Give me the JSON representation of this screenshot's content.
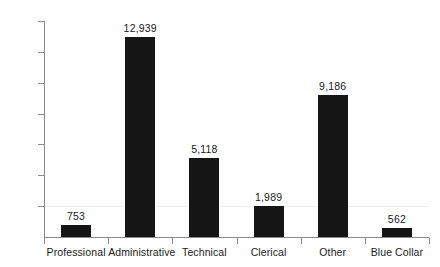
{
  "chart_data": {
    "type": "bar",
    "title": "",
    "subtitle": "",
    "xlabel": "",
    "ylabel": "",
    "categories": [
      "Professional",
      "Administrative",
      "Technical",
      "Clerical",
      "Other",
      "Blue Collar"
    ],
    "values": [
      753,
      12939,
      5118,
      1989,
      9186,
      562
    ],
    "value_labels": [
      "753",
      "12,939",
      "5,118",
      "1,989",
      "9,186",
      "562"
    ],
    "ylim": [
      0,
      14000
    ],
    "y_ticks": [
      2000,
      4000,
      6000,
      8000,
      10000,
      12000,
      14000
    ],
    "y_tick_labels": [
      "2,000",
      "4,000",
      "6,000",
      "8,000",
      "0,000",
      "2,000",
      "4,000"
    ],
    "y_tick_labels_note": "leading digit of 10,000 / 12,000 / 14,000 is clipped at the left image edge",
    "grid": true,
    "gridlines_at": [
      2000
    ],
    "legend": null,
    "legend_position": "none",
    "bar_color": "#151515",
    "axis_color": "#8a8a8a",
    "grid_color": "#ededed",
    "background_color": "#ffffff"
  }
}
